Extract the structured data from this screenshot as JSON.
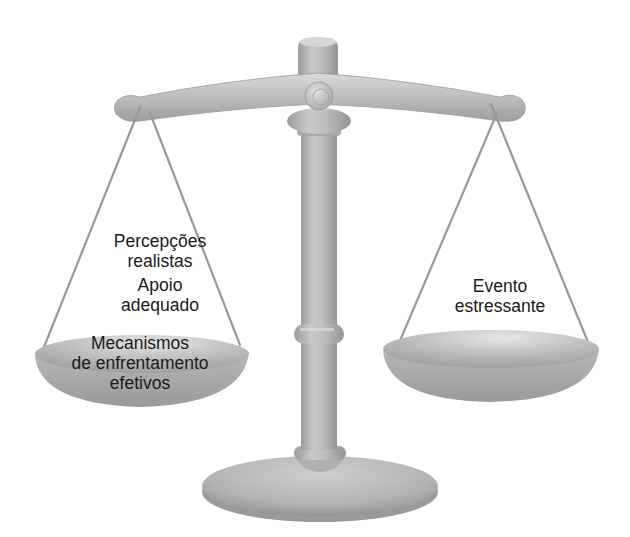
{
  "diagram": {
    "type": "balance-scale",
    "colors": {
      "metal_light": "#d2d2d2",
      "metal_mid": "#b5b5b5",
      "metal_dark": "#8f8f8f",
      "string": "#9a9a9a",
      "text": "#1a1a1a",
      "background": "#ffffff"
    },
    "left_pan": {
      "items": [
        {
          "lines": [
            "Percepções",
            "realistas"
          ]
        },
        {
          "lines": [
            "Apoio",
            "adequado"
          ]
        },
        {
          "lines": [
            "Mecanismos",
            "de enfrentamento",
            "efetivos"
          ]
        }
      ]
    },
    "right_pan": {
      "items": [
        {
          "lines": [
            "Evento",
            "estressante"
          ]
        }
      ]
    }
  }
}
